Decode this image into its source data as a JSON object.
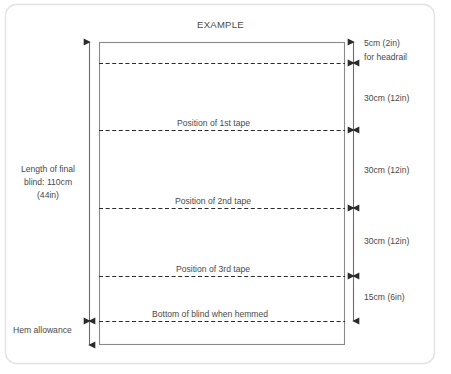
{
  "diagram": {
    "title": "EXAMPLE",
    "type": "roman-blind-measurement-diagram",
    "colors": {
      "card_border": "#e3e3e3",
      "rect_outline": "#7a7a7a",
      "dashed_line": "#2b2b2b",
      "dimension_line": "#6b6b6b",
      "text": "#4a4a4a",
      "background": "#ffffff"
    },
    "left_dimension": {
      "label_line1": "Length of final",
      "label_line2": "blind: 110cm",
      "label_line3": "(44in)",
      "hem_label": "Hem allowance"
    },
    "right_dimensions": [
      {
        "value": "5cm (2in)",
        "note": "for headrail"
      },
      {
        "value": "30cm (12in)",
        "note": ""
      },
      {
        "value": "30cm (12in)",
        "note": ""
      },
      {
        "value": "30cm (12in)",
        "note": ""
      },
      {
        "value": "15cm (6in)",
        "note": ""
      }
    ],
    "inner_labels": [
      {
        "text": "Position of 1st tape"
      },
      {
        "text": "Position of 2nd tape"
      },
      {
        "text": "Position of 3rd tape"
      },
      {
        "text": "Bottom of blind when hemmed"
      }
    ]
  }
}
